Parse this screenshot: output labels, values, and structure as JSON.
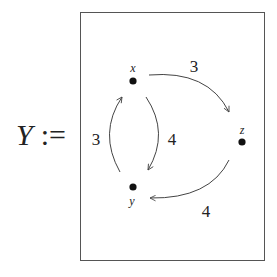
{
  "equation": {
    "symbol": "Υ",
    "operator": ":="
  },
  "graph": {
    "nodes": [
      {
        "id": "x",
        "label": "x",
        "cx": 133,
        "cy": 81,
        "label_x": 133,
        "label_y": 72
      },
      {
        "id": "y",
        "label": "y",
        "cx": 133,
        "cy": 187,
        "label_x": 132,
        "label_y": 206
      },
      {
        "id": "z",
        "label": "z",
        "cx": 242,
        "cy": 142,
        "label_x": 242,
        "label_y": 133
      }
    ],
    "edges": [
      {
        "from": "x",
        "to": "z",
        "weight": "3"
      },
      {
        "from": "x",
        "to": "y",
        "weight": "4"
      },
      {
        "from": "y",
        "to": "x",
        "weight": "3"
      },
      {
        "from": "z",
        "to": "y",
        "weight": "4"
      }
    ],
    "colors": {
      "stroke": "#444444",
      "node": "#111111",
      "frame": "#555555"
    }
  }
}
